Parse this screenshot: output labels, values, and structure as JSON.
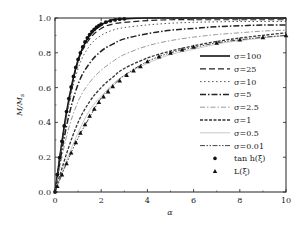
{
  "chart_data": {
    "type": "line",
    "title": "",
    "xlabel": "α",
    "ylabel": "M/M_s",
    "ylabel_main": "M/M",
    "ylabel_sub": "s",
    "xlim": [
      0,
      10
    ],
    "ylim": [
      0,
      1.0
    ],
    "grid": false,
    "legend_position": "lower right (inside)",
    "x_ticks": [
      0,
      2,
      4,
      6,
      8,
      10
    ],
    "x_tick_labels": [
      "0",
      "2",
      "4",
      "6",
      "8",
      "10"
    ],
    "y_ticks": [
      0,
      0.2,
      0.4,
      0.6,
      0.8,
      1.0
    ],
    "y_tick_labels": [
      "0.0",
      "0.2",
      "0.4",
      "0.6",
      "0.8",
      "1.0"
    ],
    "x": [
      0,
      0.5,
      1,
      1.5,
      2,
      2.5,
      3,
      4,
      5,
      6,
      7,
      8,
      9,
      10
    ],
    "series": [
      {
        "name": "σ=100",
        "label": "σ=100",
        "style": "solid",
        "width": 1.6,
        "color": "#111111",
        "values": [
          0,
          0.46,
          0.76,
          0.9,
          0.96,
          0.99,
          0.995,
          1.0,
          1.0,
          1.0,
          1.0,
          1.0,
          1.0,
          1.0
        ]
      },
      {
        "name": "σ=25",
        "label": "σ=25",
        "style": "dash",
        "width": 1.2,
        "color": "#222222",
        "values": [
          0,
          0.45,
          0.75,
          0.88,
          0.94,
          0.965,
          0.975,
          0.985,
          0.99,
          0.99,
          0.99,
          0.99,
          0.99,
          0.99
        ]
      },
      {
        "name": "σ=10",
        "label": "σ=10",
        "style": "dot",
        "width": 1.0,
        "color": "#555555",
        "values": [
          0,
          0.43,
          0.71,
          0.84,
          0.9,
          0.93,
          0.945,
          0.96,
          0.97,
          0.975,
          0.978,
          0.98,
          0.98,
          0.98
        ]
      },
      {
        "name": "σ=5",
        "label": "σ=5",
        "style": "dashdot",
        "width": 1.5,
        "color": "#222222",
        "values": [
          0,
          0.38,
          0.62,
          0.74,
          0.81,
          0.85,
          0.88,
          0.91,
          0.93,
          0.94,
          0.95,
          0.955,
          0.96,
          0.96
        ]
      },
      {
        "name": "σ=2.5",
        "label": "σ=2.5",
        "style": "dashdotlight",
        "width": 1.0,
        "color": "#999999",
        "values": [
          0,
          0.32,
          0.52,
          0.63,
          0.7,
          0.75,
          0.79,
          0.84,
          0.87,
          0.89,
          0.905,
          0.915,
          0.925,
          0.93
        ]
      },
      {
        "name": "σ=1",
        "label": "σ=1",
        "style": "shortdash",
        "width": 1.3,
        "color": "#333333",
        "values": [
          0,
          0.22,
          0.4,
          0.52,
          0.6,
          0.66,
          0.71,
          0.77,
          0.81,
          0.84,
          0.865,
          0.885,
          0.9,
          0.915
        ]
      },
      {
        "name": "σ=0.5",
        "label": "σ=0.5",
        "style": "solidlight",
        "width": 0.8,
        "color": "#bbbbbb",
        "values": [
          0,
          0.18,
          0.34,
          0.47,
          0.55,
          0.62,
          0.67,
          0.74,
          0.79,
          0.82,
          0.85,
          0.87,
          0.885,
          0.9
        ]
      },
      {
        "name": "σ=0.01",
        "label": "σ=0.01",
        "style": "dashdotdot",
        "width": 1.0,
        "color": "#444444",
        "values": [
          0,
          0.165,
          0.31,
          0.43,
          0.54,
          0.61,
          0.67,
          0.75,
          0.8,
          0.83,
          0.857,
          0.875,
          0.889,
          0.9
        ]
      }
    ],
    "markers": [
      {
        "name": "tan h(ξ)",
        "label_main": "tan h",
        "label_arg": "(ξ)",
        "symbol": "circle",
        "color": "#111111",
        "x": [
          0,
          0.1,
          0.2,
          0.3,
          0.4,
          0.5,
          0.6,
          0.7,
          0.8,
          0.9,
          1.0,
          1.1,
          1.2,
          1.3,
          1.4,
          1.5,
          1.6,
          1.7,
          1.8,
          1.9,
          2.0,
          2.2,
          2.4,
          2.6,
          2.8,
          3.0
        ],
        "values": [
          0,
          0.1,
          0.197,
          0.291,
          0.38,
          0.462,
          0.537,
          0.604,
          0.664,
          0.716,
          0.762,
          0.8,
          0.834,
          0.862,
          0.885,
          0.905,
          0.922,
          0.935,
          0.947,
          0.956,
          0.964,
          0.976,
          0.984,
          0.989,
          0.993,
          0.995
        ]
      },
      {
        "name": "L(ξ)",
        "label_main": "L",
        "label_arg": "(ξ)",
        "symbol": "triangle",
        "color": "#111111",
        "x": [
          0.1,
          0.3,
          0.5,
          0.7,
          0.9,
          1.1,
          1.3,
          1.5,
          1.7,
          1.9,
          2.1,
          2.3,
          2.5,
          2.8,
          3.1,
          3.4,
          3.7,
          4.0,
          4.5,
          5.0,
          5.5,
          6.0,
          7.0,
          8.0,
          9.0,
          10.0
        ],
        "values": [
          0.033,
          0.1,
          0.164,
          0.226,
          0.285,
          0.339,
          0.389,
          0.438,
          0.478,
          0.516,
          0.548,
          0.577,
          0.607,
          0.64,
          0.672,
          0.698,
          0.722,
          0.75,
          0.778,
          0.8,
          0.818,
          0.834,
          0.857,
          0.875,
          0.889,
          0.9
        ]
      }
    ]
  },
  "legend": {
    "items": [
      {
        "label": "σ=100"
      },
      {
        "label": "σ=25"
      },
      {
        "label": "σ=10"
      },
      {
        "label": "σ=5"
      },
      {
        "label": "σ=2.5"
      },
      {
        "label": "σ=1"
      },
      {
        "label": "σ=0.5"
      },
      {
        "label": "σ=0.01"
      },
      {
        "label": "tan h(ξ)"
      },
      {
        "label": "L(ξ)"
      }
    ]
  }
}
